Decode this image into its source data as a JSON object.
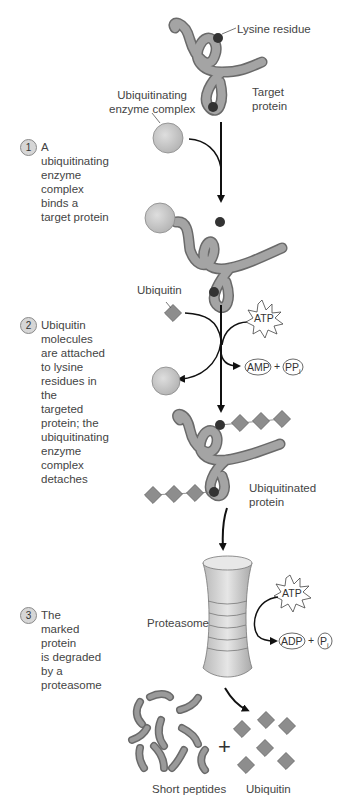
{
  "labels": {
    "lysine_residue": "Lysine residue",
    "ubiquitinating_enzyme_complex": "Ubiquitinating\nenzyme complex",
    "target_protein": "Target\nprotein",
    "ubiquitin_top": "Ubiquitin",
    "ubiquitinated_protein": "Ubiquitinated\nprotein",
    "proteasome": "Proteasome",
    "short_peptides": "Short peptides",
    "ubiquitin_bottom": "Ubiquitin",
    "plus": "+"
  },
  "steps": [
    {
      "number": "1",
      "text": "A ubiquitinating\nenzyme complex\nbinds a target protein"
    },
    {
      "number": "2",
      "text": "Ubiquitin molecules\nare attached to lysine\nresidues in the\ntargeted protein; the\nubiquitinating enzyme\ncomplex detaches"
    },
    {
      "number": "3",
      "text": "The marked protein\nis degraded by a\nproteasome"
    }
  ],
  "molecules": {
    "atp": "ATP",
    "amp": "AMP",
    "ppi": "PP",
    "ppi_sub": "i",
    "adp": "ADP",
    "pi": "P",
    "pi_sub": "i",
    "plus": "+"
  },
  "colors": {
    "protein": "#9a9a9a",
    "protein_outline": "#6e6e6e",
    "lysine": "#333333",
    "enzyme": "#cfcfcf",
    "ubiquitin": "#8d8d8d",
    "arrow": "#111111"
  }
}
